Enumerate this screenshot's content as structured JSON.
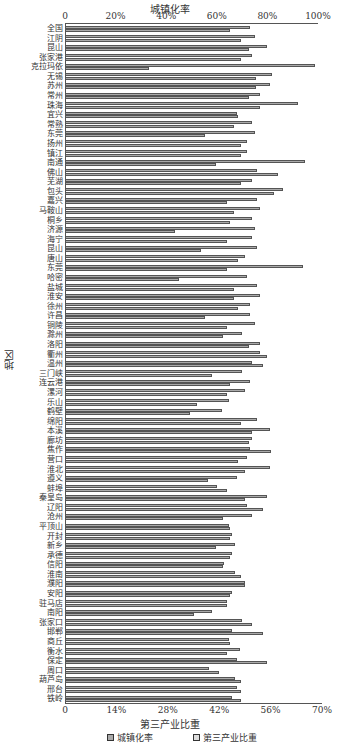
{
  "chart_data": {
    "type": "bar",
    "orientation": "horizontal",
    "title_top": "城镇化率",
    "xlabel_bottom": "第三产业比重",
    "ylabel": "地区",
    "top_axis_ticks": [
      "0",
      "20%",
      "40%",
      "60%",
      "80%",
      "100%"
    ],
    "top_axis_range": [
      0,
      100
    ],
    "bottom_axis_ticks": [
      "0",
      "14%",
      "28%",
      "42%",
      "56%",
      "70%"
    ],
    "bottom_axis_range": [
      0,
      70
    ],
    "legend": [
      "城镇化率",
      "第三产业比重"
    ],
    "categories": [
      "全国",
      "江阴",
      "昆山",
      "张家港",
      "克拉玛依",
      "无锡",
      "苏州",
      "常州",
      "珠海",
      "宜兴",
      "常熟",
      "东莞",
      "扬州",
      "镇江",
      "南通",
      "佛山",
      "芜湖",
      "包头",
      "嘉兴",
      "马鞍山",
      "桐乡",
      "济源",
      "海宁",
      "昆山2",
      "唐山",
      "东莞2",
      "哈密",
      "盐城",
      "淮安",
      "徐州",
      "许昌",
      "铜陵",
      "滁州",
      "洛阳",
      "衢州",
      "温州",
      "三门峡",
      "连云港",
      "漯河",
      "乐山",
      "鹤壁",
      "绵阳",
      "本溪",
      "廊坊",
      "焦作",
      "营口",
      "淮北",
      "遵义",
      "蚌埠",
      "秦皇岛",
      "辽阳",
      "沧州",
      "平顶山",
      "开封",
      "新乡",
      "承德",
      "信阳",
      "淮南",
      "濮阳",
      "安阳",
      "驻马店",
      "南阳",
      "张家口",
      "邯郸",
      "商丘",
      "衡水",
      "保定",
      "周口",
      "葫芦岛",
      "邢台",
      "铁岭"
    ],
    "series": [
      {
        "name": "城镇化率",
        "values": [
          73,
          75,
          80,
          74,
          99,
          82,
          81,
          77,
          92,
          68,
          74,
          75,
          72,
          72,
          95,
          76,
          74,
          86,
          76,
          77,
          74,
          75,
          74,
          76,
          71,
          94,
          72,
          76,
          77,
          73,
          73,
          75,
          70,
          77,
          77,
          74,
          70,
          73,
          71,
          65,
          62,
          76,
          81,
          74,
          73,
          72,
          81,
          68,
          60,
          80,
          72,
          74,
          65,
          66,
          67,
          66,
          63,
          67,
          71,
          66,
          64,
          58,
          70,
          66,
          65,
          69,
          68,
          57,
          67,
          68,
          66
        ]
      },
      {
        "name": "第三产业比重",
        "values": [
          45,
          48,
          50,
          48,
          23,
          52,
          52,
          50,
          53,
          47,
          46,
          38,
          48,
          48,
          41,
          58,
          48,
          57,
          44,
          46,
          45,
          30,
          44,
          37,
          47,
          44,
          31,
          46,
          46,
          47,
          38,
          44,
          43,
          50,
          55,
          54,
          40,
          45,
          44,
          36,
          34,
          48,
          51,
          50,
          56,
          47,
          49,
          39,
          44,
          49,
          54,
          43,
          45,
          45,
          41,
          45,
          43,
          48,
          49,
          45,
          44,
          35,
          51,
          54,
          45,
          44,
          55,
          42,
          48,
          48,
          48
        ]
      }
    ]
  }
}
